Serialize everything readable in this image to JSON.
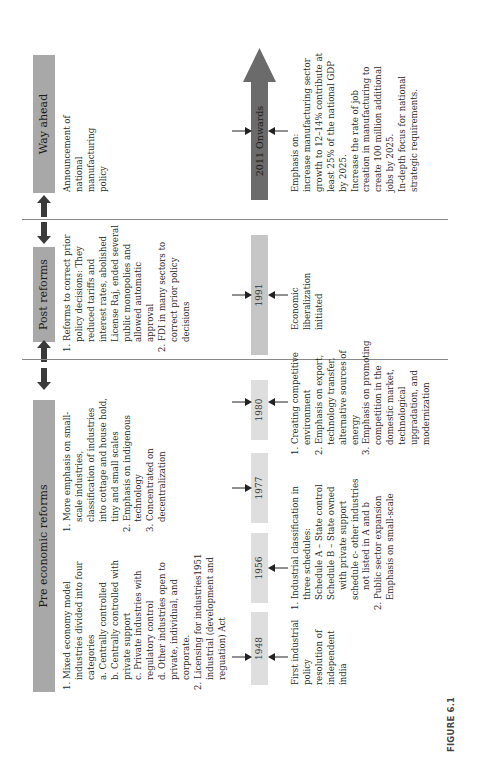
{
  "figure_label": "FIGURE 6.1",
  "sections": [
    {
      "title": "Pre economic reforms",
      "columns": [
        {
          "items": [
            "1. Mixed economy model industries divided into four categories",
            "a. Centrally controlled",
            "b. Centrally controlled with private support",
            "c. Private industries with regulatory control",
            "d. Other industries open to private, individual, and corporate.",
            "2. Licensing for industries1951 industrial (development and reguation) Act"
          ]
        },
        {
          "items": [
            "1. More emphasis on small-scale industries, classification of industries into cottage and house hold, tiny and small scales",
            "2. Emphasis on indigenous technology",
            "3. Concentrated on decentralization"
          ]
        }
      ]
    },
    {
      "title": "Post reforms",
      "items": [
        "1. Reforms to correct prior policy decisions: They reduced tariffs and interest rates, abolished License Raj, ended several public monopolies and allowed automatic approval",
        "2. FDI in many sectors to correct prior policy decisions"
      ]
    },
    {
      "title": "Way ahead",
      "items": [
        "Announcement of national manufacturing policy"
      ]
    }
  ],
  "timeline": [
    {
      "year": "1948",
      "description": [
        "First industrial policy resolution of independent india"
      ]
    },
    {
      "year": "1956",
      "description": [
        "1. Industrial classification in three schedules:",
        "Schedule A – State control",
        "Schedule B – State owned with private support",
        "schedule c- other industries not listed in A and b",
        "2. Public sector expansion",
        "Emphasis on small-scale"
      ]
    },
    {
      "year": "1977",
      "description": []
    },
    {
      "year": "1980",
      "description": [
        "1. Creating competitive environment",
        "2. Emphasis on export, technology transfer, alternative sources of energy",
        "3. Emphasis on promoting competition in the domestic market, technological upgradation, and modernization"
      ]
    },
    {
      "year": "1991",
      "description": [
        "Economic liberalization initiated"
      ]
    },
    {
      "year": "2011 Onwards",
      "description": [
        "Emphasis on:",
        "increase manufacturing sector growth to 12–14% contribute at least 25% of the national GDP by 2025.",
        "Increase the rate of job creation in manufacturing to create 100 million additional jobs by 2025.",
        "In-depth focus for national strategic requirements."
      ]
    }
  ],
  "colors": {
    "header_fill": "#a8a8a8",
    "year_fill": "#dedede",
    "year_fill_1991": "#c6c6c6",
    "big_arrow_fill": "#6b6b6b",
    "divider": "#888888",
    "block_arrow": "#3a3a3a"
  }
}
